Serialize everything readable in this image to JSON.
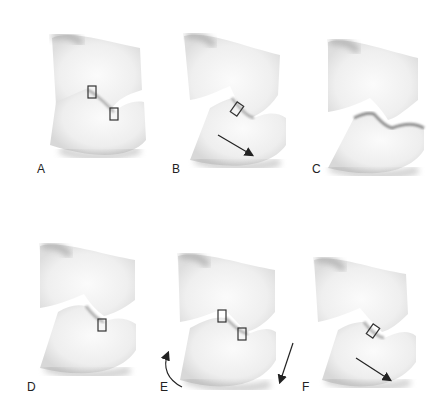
{
  "figure": {
    "panels": [
      {
        "id": "A",
        "label": "A",
        "markers": 2,
        "arrows": []
      },
      {
        "id": "B",
        "label": "B",
        "markers": 1,
        "arrows": [
          "straight-down-right"
        ]
      },
      {
        "id": "C",
        "label": "C",
        "markers": 0,
        "arrows": []
      },
      {
        "id": "D",
        "label": "D",
        "markers": 1,
        "arrows": []
      },
      {
        "id": "E",
        "label": "E",
        "markers": 2,
        "arrows": [
          "curved-up",
          "straight-down-left"
        ]
      },
      {
        "id": "F",
        "label": "F",
        "markers": 1,
        "arrows": [
          "straight-down-right"
        ]
      }
    ],
    "colors": {
      "background": "#ffffff",
      "tooth": "#f2f2f2",
      "shadow": "#b8b8b8",
      "marker": "#333333",
      "arrow": "#222222"
    }
  }
}
